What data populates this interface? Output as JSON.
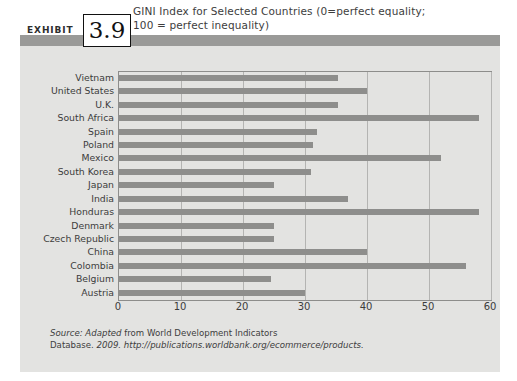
{
  "exhibit": {
    "label": "EXHIBIT",
    "number": "3.9"
  },
  "title": {
    "line1": "GINI Index for Selected Countries (0=perfect equality;",
    "line2": "100 = perfect inequality)"
  },
  "source": {
    "prefix_italic": "Source: Adapted",
    "mid_plain": "from World Development Indicators Database.",
    "year_italic": "2009.",
    "url_italic": "http://publications.worldbank.org/ecommerce/products."
  },
  "colors": {
    "panel_background": "#e3e3e1",
    "panel_top_band": "#9a9a98",
    "bar_fill": "#8e8e8c",
    "gridline": "#b4b4b2",
    "plot_border": "#8d8d8b",
    "text": "#3c3c3c",
    "exhibit_box_border": "#111111"
  },
  "chart_data": {
    "type": "bar",
    "orientation": "horizontal",
    "title": "GINI Index for Selected Countries (0=perfect equality; 100 = perfect inequality)",
    "xlabel": "",
    "ylabel": "",
    "xlim": [
      0,
      60
    ],
    "xticks": [
      0,
      10,
      20,
      30,
      40,
      50,
      60
    ],
    "grid": true,
    "legend": false,
    "categories": [
      "Vietnam",
      "United States",
      "U.K.",
      "South Africa",
      "Spain",
      "Poland",
      "Mexico",
      "South Korea",
      "Japan",
      "India",
      "Honduras",
      "Denmark",
      "Czech Republic",
      "China",
      "Colombia",
      "Belgium",
      "Austria"
    ],
    "values": [
      35.4,
      40.0,
      35.4,
      58.0,
      32.0,
      31.3,
      52.0,
      31.0,
      25.0,
      37.0,
      58.0,
      25.0,
      25.0,
      40.0,
      56.0,
      24.5,
      30.0
    ]
  }
}
